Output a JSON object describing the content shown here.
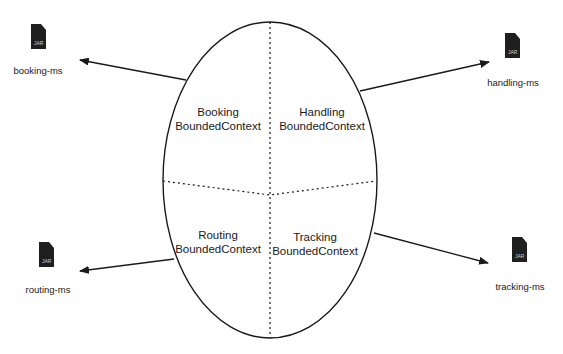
{
  "diagram": {
    "colors": {
      "background": "#ffffff",
      "stroke": "#1a1a1a",
      "jar_icon": "#1f1f1f",
      "jar_icon_text": "#cfcfcf"
    },
    "ellipse": {
      "cx": 270,
      "cy": 180,
      "rx": 107,
      "ry": 158
    },
    "contexts": [
      {
        "id": "booking",
        "line1": "Booking",
        "line2": "BoundedContext"
      },
      {
        "id": "handling",
        "line1": "Handling",
        "line2": "BoundedContext"
      },
      {
        "id": "routing",
        "line1": "Routing",
        "line2": "BoundedContext"
      },
      {
        "id": "tracking",
        "line1": "Tracking",
        "line2": "BoundedContext"
      }
    ],
    "microservices": [
      {
        "id": "booking",
        "label": "booking-ms",
        "icon": "jar-file-icon",
        "icon_text": "JAR"
      },
      {
        "id": "handling",
        "label": "handling-ms",
        "icon": "jar-file-icon",
        "icon_text": "JAR"
      },
      {
        "id": "routing",
        "label": "routing-ms",
        "icon": "jar-file-icon",
        "icon_text": "JAR"
      },
      {
        "id": "tracking",
        "label": "tracking-ms",
        "icon": "jar-file-icon",
        "icon_text": "JAR"
      }
    ]
  }
}
